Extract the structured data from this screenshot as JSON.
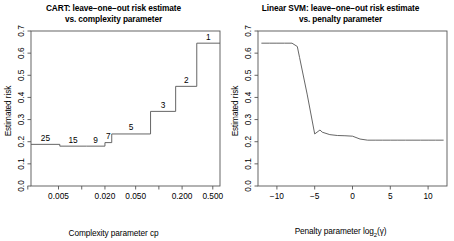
{
  "figure": {
    "width": 454,
    "height": 241,
    "background": "#ffffff",
    "line_color": "#555555",
    "axis_color": "#555555",
    "text_color": "#000000"
  },
  "panels": [
    {
      "id": "cart",
      "title_line1": "CART: leave−one−out risk estimate",
      "title_line2": "vs. complexity parameter",
      "xlabel": "Complexity parameter cp",
      "ylabel": "Estimated risk"
    },
    {
      "id": "svm",
      "title_line1": "Linear SVM: leave−one−out risk estimate",
      "title_line2": "vs. penalty parameter",
      "xlabel_pre": "Penalty parameter log",
      "xlabel_sub": "2",
      "xlabel_post": "(γ)",
      "ylabel": "Estimated risk"
    }
  ],
  "chart_data": [
    {
      "type": "line",
      "subtype": "step",
      "title": "CART: leave-one-out risk estimate vs. complexity parameter",
      "xlabel": "Complexity parameter cp",
      "ylabel": "Estimated risk",
      "xscale": "log",
      "xlim": [
        0.0022,
        0.62
      ],
      "ylim": [
        0.0,
        0.7
      ],
      "grid": false,
      "legend": null,
      "xticks": [
        0.002,
        0.005,
        0.01,
        0.02,
        0.05,
        0.1,
        0.2,
        0.5
      ],
      "xticklabels": [
        "",
        "0.005",
        "",
        "0.020",
        "0.050",
        "",
        "0.200",
        "0.500"
      ],
      "yticks": [
        0.0,
        0.1,
        0.2,
        0.3,
        0.4,
        0.5,
        0.6,
        0.7
      ],
      "yticklabels": [
        "0.0",
        "0.1",
        "0.2",
        "0.3",
        "0.4",
        "0.5",
        "0.6",
        "0.7"
      ],
      "steps": [
        {
          "label": "25",
          "x_start": 0.0022,
          "x_end": 0.0052,
          "y": 0.188
        },
        {
          "label": "15",
          "x_start": 0.0052,
          "x_end": 0.0115,
          "y": 0.18
        },
        {
          "label": "9",
          "x_start": 0.0115,
          "x_end": 0.02,
          "y": 0.18
        },
        {
          "label": "7",
          "x_start": 0.02,
          "x_end": 0.0245,
          "y": 0.196
        },
        {
          "label": "5",
          "x_start": 0.0245,
          "x_end": 0.078,
          "y": 0.235
        },
        {
          "label": "3",
          "x_start": 0.078,
          "x_end": 0.165,
          "y": 0.337
        },
        {
          "label": "2",
          "x_start": 0.165,
          "x_end": 0.31,
          "y": 0.45
        },
        {
          "label": "1",
          "x_start": 0.31,
          "x_end": 0.62,
          "y": 0.645
        }
      ]
    },
    {
      "type": "line",
      "title": "Linear SVM: leave-one-out risk estimate vs. penalty parameter",
      "xlabel": "Penalty parameter log2(gamma)",
      "ylabel": "Estimated risk",
      "xscale": "linear",
      "xlim": [
        -12.5,
        12.5
      ],
      "ylim": [
        0.0,
        0.7
      ],
      "grid": false,
      "legend": null,
      "xticks": [
        -10,
        -5,
        0,
        5,
        10
      ],
      "xticklabels": [
        "−10",
        "−5",
        "0",
        "5",
        "10"
      ],
      "yticks": [
        0.0,
        0.1,
        0.2,
        0.3,
        0.4,
        0.5,
        0.6,
        0.7
      ],
      "yticklabels": [
        "0.0",
        "0.1",
        "0.2",
        "0.3",
        "0.4",
        "0.5",
        "0.6",
        "0.7"
      ],
      "x": [
        -12,
        -11,
        -10,
        -9,
        -8,
        -7.3,
        -7,
        -6,
        -5,
        -4.3,
        -4,
        -3,
        -2,
        -1,
        0,
        1,
        2,
        3,
        4,
        5,
        6,
        7,
        8,
        9,
        10,
        11,
        12
      ],
      "y": [
        0.645,
        0.645,
        0.645,
        0.645,
        0.645,
        0.63,
        0.58,
        0.415,
        0.235,
        0.253,
        0.243,
        0.232,
        0.228,
        0.227,
        0.225,
        0.212,
        0.207,
        0.207,
        0.207,
        0.207,
        0.207,
        0.207,
        0.207,
        0.207,
        0.207,
        0.207,
        0.207
      ]
    }
  ]
}
